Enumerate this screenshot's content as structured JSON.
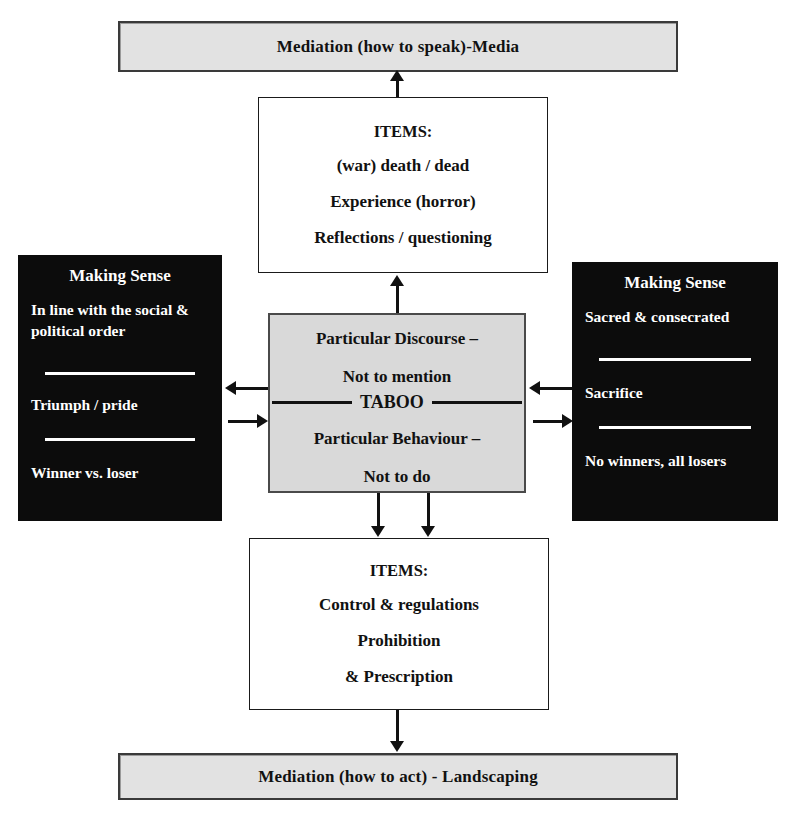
{
  "diagram": {
    "title_top": "Mediation (how to speak)-Media",
    "title_bottom": "Mediation (how to act) - Landscaping",
    "colors": {
      "banner_fill": "#e2e2e2",
      "center_fill": "#d9d9d9",
      "black_fill": "#0c0c0c",
      "ink": "#111111",
      "paper": "#ffffff"
    }
  },
  "top_items": {
    "header": "ITEMS:",
    "lines": [
      "(war) death / dead",
      "Experience (horror)",
      "Reflections / questioning"
    ]
  },
  "bottom_items": {
    "header": "ITEMS:",
    "lines": [
      "Control & regulations",
      "Prohibition",
      "& Prescription"
    ]
  },
  "center": {
    "upper_line1": "Particular Discourse –",
    "upper_line2": "Not to mention",
    "keyword": "TABOO",
    "lower_line1": "Particular Behaviour –",
    "lower_line2": "Not to do"
  },
  "left_panel": {
    "title": "Making Sense",
    "body": "In line with the social & political order",
    "middle": "Triumph / pride",
    "bottom": "Winner vs. loser"
  },
  "right_panel": {
    "title": "Making Sense",
    "body": "Sacred & consecrated",
    "middle": "Sacrifice",
    "bottom": "No winners, all losers"
  }
}
